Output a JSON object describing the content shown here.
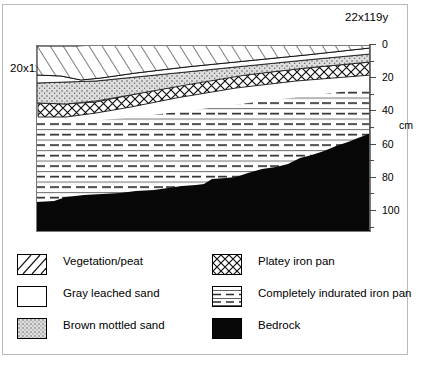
{
  "figure": {
    "type": "soil-profile-cross-section",
    "site_labels": {
      "left": "20x119y",
      "right": "22x119y"
    },
    "axis": {
      "unit_label": "cm",
      "ticks": [
        0,
        10,
        20,
        30,
        40,
        50,
        60,
        70,
        80,
        90,
        100,
        110
      ],
      "major_ticks": [
        0,
        20,
        40,
        60,
        80,
        100
      ],
      "tick_labels": [
        "0",
        "20",
        "40",
        "60",
        "80",
        "100"
      ],
      "range_cm": [
        0,
        112
      ],
      "orientation": "depth-increases-downward"
    },
    "legend": {
      "left_column": [
        {
          "label": "Vegetation/peat",
          "pattern": "diagonal-hatch"
        },
        {
          "label": "Gray leached sand",
          "pattern": "blank-white"
        },
        {
          "label": "Brown mottled sand",
          "pattern": "stipple-dotted"
        }
      ],
      "right_column": [
        {
          "label": "Platey iron pan",
          "pattern": "cross-hatch-diamond"
        },
        {
          "label": "Completely indurated iron pan",
          "pattern": "horizontal-dashed-lines"
        },
        {
          "label": "Bedrock",
          "pattern": "solid-black"
        }
      ]
    },
    "colors": {
      "ink": "#000000",
      "frame": "#b9b9b9",
      "axis": "#4a4a4a",
      "stipple_fill": "#dcdcdc",
      "bedrock": "#080808",
      "paper": "#ffffff"
    },
    "layer_order_top_to_bottom": [
      "Vegetation/peat",
      "Gray leached sand",
      "Brown mottled sand",
      "Platey iron pan",
      "Completely indurated iron pan",
      "Bedrock"
    ]
  }
}
